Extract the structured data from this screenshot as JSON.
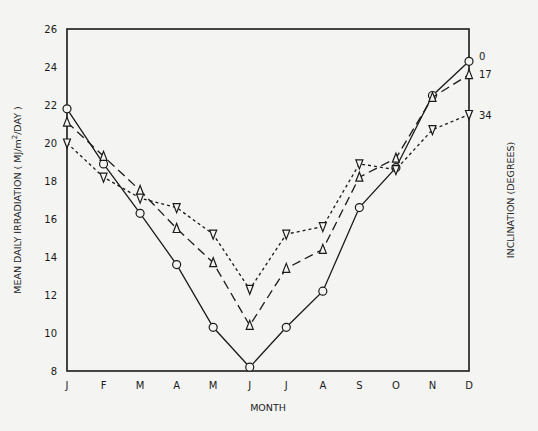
{
  "chart_data": {
    "type": "line",
    "title": "",
    "xlabel": "MONTH",
    "ylabel": "MEAN DAILY  IRRADIATION ( MJ/m²/DAY )",
    "right_label": "INCLINATION (DEGREES)",
    "categories": [
      "J",
      "F",
      "M",
      "A",
      "M",
      "J",
      "J",
      "A",
      "S",
      "O",
      "N",
      "D"
    ],
    "ylim": [
      8,
      26
    ],
    "yticks": [
      8,
      10,
      12,
      14,
      16,
      18,
      20,
      22,
      24,
      26
    ],
    "grid": false,
    "legend_position": "right-end labels",
    "series": [
      {
        "name": "0",
        "marker": "circle",
        "line_style": "solid",
        "values": [
          21.8,
          18.9,
          16.3,
          13.6,
          10.3,
          8.2,
          10.3,
          12.2,
          16.6,
          18.7,
          22.5,
          24.3
        ]
      },
      {
        "name": "17",
        "marker": "triangle-up",
        "line_style": "long-dash",
        "values": [
          21.1,
          19.3,
          17.5,
          15.5,
          13.7,
          10.4,
          13.4,
          14.4,
          18.2,
          19.2,
          22.4,
          23.6
        ]
      },
      {
        "name": "34",
        "marker": "triangle-down",
        "line_style": "short-dash",
        "values": [
          20.0,
          18.2,
          17.1,
          16.6,
          15.2,
          12.3,
          15.2,
          15.6,
          18.9,
          18.6,
          20.7,
          21.5
        ]
      }
    ]
  },
  "labels": {
    "xlabel": "MONTH",
    "ylabel": "MEAN DAILY  IRRADIATION ( MJ/m",
    "ylabel_sup": "2",
    "ylabel_tail": "/DAY )",
    "right_label": "INCLINATION (DEGREES)"
  }
}
